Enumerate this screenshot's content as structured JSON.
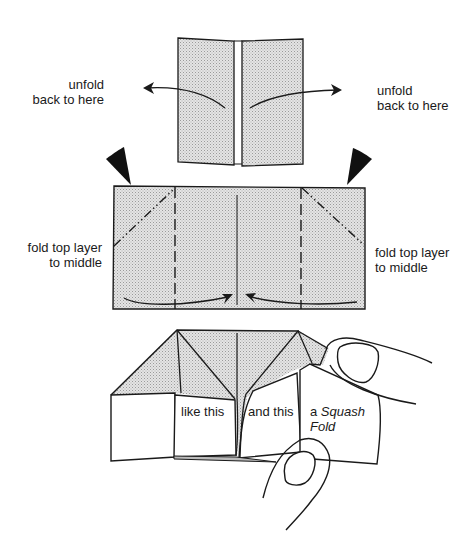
{
  "diagram": {
    "title": "",
    "steps": [
      {
        "id": "step-unfold",
        "labels": {
          "left_line1": "unfold",
          "left_line2": "back to here",
          "right_line1": "unfold",
          "right_line2": "back to here"
        }
      },
      {
        "id": "step-fold-top-layer",
        "labels": {
          "left_line1": "fold top layer",
          "left_line2": "to middle",
          "right_line1": "fold top layer",
          "right_line2": "to middle"
        }
      },
      {
        "id": "step-squash-fold",
        "labels": {
          "panel1": "like this",
          "panel2": "and this",
          "panel3_prefix": "a ",
          "panel3_italic": "Squash",
          "panel3_line2": "Fold"
        }
      }
    ],
    "colors": {
      "paper_fill": "#d9d9d9",
      "line": "#1a1a1a",
      "background": "#ffffff"
    },
    "icons": [
      "arrow-left-curved-icon",
      "arrow-right-curved-icon",
      "push-arrow-icon",
      "fold-arrow-icon",
      "finger-icon"
    ]
  }
}
